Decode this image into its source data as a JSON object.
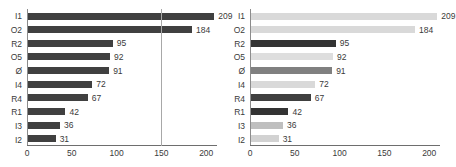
{
  "figure": {
    "panels": [
      {
        "name": "left-panel",
        "uniform_bar_color": "#404040",
        "reference_line": {
          "value": 150,
          "color": "#a8a8a8"
        }
      },
      {
        "name": "right-panel",
        "reference_line": null
      }
    ],
    "caption_clipped": "· ·· · ·· · ·· ·· · · ·· · ·· · · ·· · ··"
  },
  "chart_data": [
    {
      "type": "bar",
      "orientation": "horizontal",
      "title": "",
      "subtitle": "",
      "xlabel": "",
      "ylabel": "",
      "categories": [
        "I1",
        "O2",
        "R2",
        "O5",
        "Ø",
        "I4",
        "R4",
        "R1",
        "I3",
        "I2"
      ],
      "values": [
        209,
        184,
        95,
        92,
        91,
        72,
        67,
        42,
        36,
        31
      ],
      "value_labels": [
        "209",
        "184",
        "95",
        "92",
        "91",
        "72",
        "67",
        "42",
        "36",
        "31"
      ],
      "bar_colors": [
        "#404040",
        "#404040",
        "#404040",
        "#404040",
        "#404040",
        "#404040",
        "#404040",
        "#404040",
        "#404040",
        "#404040"
      ],
      "xlim": [
        0,
        212
      ],
      "xticks": [
        0,
        50,
        100,
        150,
        200
      ],
      "xtick_labels": [
        "0",
        "50",
        "100",
        "150",
        "200"
      ],
      "grid": false,
      "legend": null,
      "annotations": [
        {
          "type": "vline",
          "value": 150,
          "color": "#a8a8a8"
        }
      ]
    },
    {
      "type": "bar",
      "orientation": "horizontal",
      "title": "",
      "subtitle": "",
      "xlabel": "",
      "ylabel": "",
      "categories": [
        "I1",
        "O2",
        "R2",
        "O5",
        "Ø",
        "I4",
        "R4",
        "R1",
        "I3",
        "I2"
      ],
      "values": [
        209,
        184,
        95,
        92,
        91,
        72,
        67,
        42,
        36,
        31
      ],
      "value_labels": [
        "209",
        "184",
        "95",
        "92",
        "91",
        "72",
        "67",
        "42",
        "36",
        "31"
      ],
      "bar_colors": [
        "#d9d9d9",
        "#d9d9d9",
        "#333333",
        "#dedede",
        "#808080",
        "#d9d9d9",
        "#3f3f3f",
        "#333333",
        "#bfbfbf",
        "#d2d2d2"
      ],
      "xlim": [
        0,
        212
      ],
      "xticks": [
        0,
        50,
        100,
        150,
        200
      ],
      "xtick_labels": [
        "0",
        "50",
        "100",
        "150",
        "200"
      ],
      "grid": false,
      "legend": null,
      "annotations": []
    }
  ]
}
